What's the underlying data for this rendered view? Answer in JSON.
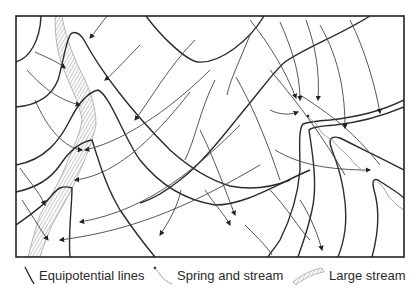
{
  "diagram": {
    "type": "flow-net",
    "colors": {
      "frame": "#222222",
      "equipotential": "#2b2b2b",
      "flowline": "#444444",
      "stream": "#999999",
      "background": "#ffffff"
    }
  },
  "legend": {
    "items": [
      {
        "icon": "equipotential-line-icon",
        "label": "Equipotential lines"
      },
      {
        "icon": "spring-stream-icon",
        "label": "Spring and stream"
      },
      {
        "icon": "large-stream-icon",
        "label": "Large stream"
      }
    ]
  }
}
